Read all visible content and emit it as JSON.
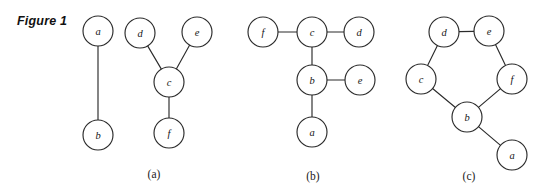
{
  "figure": {
    "label": "Figure 1",
    "background_color": "#ffffff",
    "stroke_color": "#2b2b2b",
    "node_fill_color": "#ffffff",
    "node_radius": 15
  },
  "panels": [
    {
      "caption": "(a)",
      "caption_x": 154,
      "caption_y": 168,
      "nodes": [
        {
          "id": "a",
          "label": "a",
          "x": 98,
          "y": 31
        },
        {
          "id": "b",
          "label": "b",
          "x": 98,
          "y": 135
        },
        {
          "id": "d",
          "label": "d",
          "x": 140,
          "y": 33
        },
        {
          "id": "e",
          "label": "e",
          "x": 197,
          "y": 32
        },
        {
          "id": "c",
          "label": "c",
          "x": 169,
          "y": 82
        },
        {
          "id": "f",
          "label": "f",
          "x": 169,
          "y": 133
        }
      ],
      "edges": [
        {
          "from": "a",
          "to": "b"
        },
        {
          "from": "d",
          "to": "c"
        },
        {
          "from": "e",
          "to": "c"
        },
        {
          "from": "c",
          "to": "f"
        }
      ]
    },
    {
      "caption": "(b)",
      "caption_x": 313,
      "caption_y": 170,
      "nodes": [
        {
          "id": "f",
          "label": "f",
          "x": 263,
          "y": 32
        },
        {
          "id": "c",
          "label": "c",
          "x": 312,
          "y": 32
        },
        {
          "id": "d",
          "label": "d",
          "x": 359,
          "y": 32
        },
        {
          "id": "b",
          "label": "b",
          "x": 312,
          "y": 80
        },
        {
          "id": "e",
          "label": "e",
          "x": 360,
          "y": 80
        },
        {
          "id": "a",
          "label": "a",
          "x": 312,
          "y": 132
        }
      ],
      "edges": [
        {
          "from": "f",
          "to": "c"
        },
        {
          "from": "c",
          "to": "d"
        },
        {
          "from": "c",
          "to": "b"
        },
        {
          "from": "b",
          "to": "e"
        },
        {
          "from": "b",
          "to": "a"
        }
      ]
    },
    {
      "caption": "(c)",
      "caption_x": 469,
      "caption_y": 170,
      "nodes": [
        {
          "id": "d",
          "label": "d",
          "x": 444,
          "y": 32
        },
        {
          "id": "e",
          "label": "e",
          "x": 489,
          "y": 31
        },
        {
          "id": "c",
          "label": "c",
          "x": 421,
          "y": 79
        },
        {
          "id": "f",
          "label": "f",
          "x": 512,
          "y": 79
        },
        {
          "id": "b",
          "label": "b",
          "x": 467,
          "y": 117
        },
        {
          "id": "a",
          "label": "a",
          "x": 512,
          "y": 155
        }
      ],
      "edges": [
        {
          "from": "d",
          "to": "e"
        },
        {
          "from": "d",
          "to": "c"
        },
        {
          "from": "e",
          "to": "f"
        },
        {
          "from": "c",
          "to": "b"
        },
        {
          "from": "f",
          "to": "b"
        },
        {
          "from": "b",
          "to": "a"
        }
      ]
    }
  ]
}
